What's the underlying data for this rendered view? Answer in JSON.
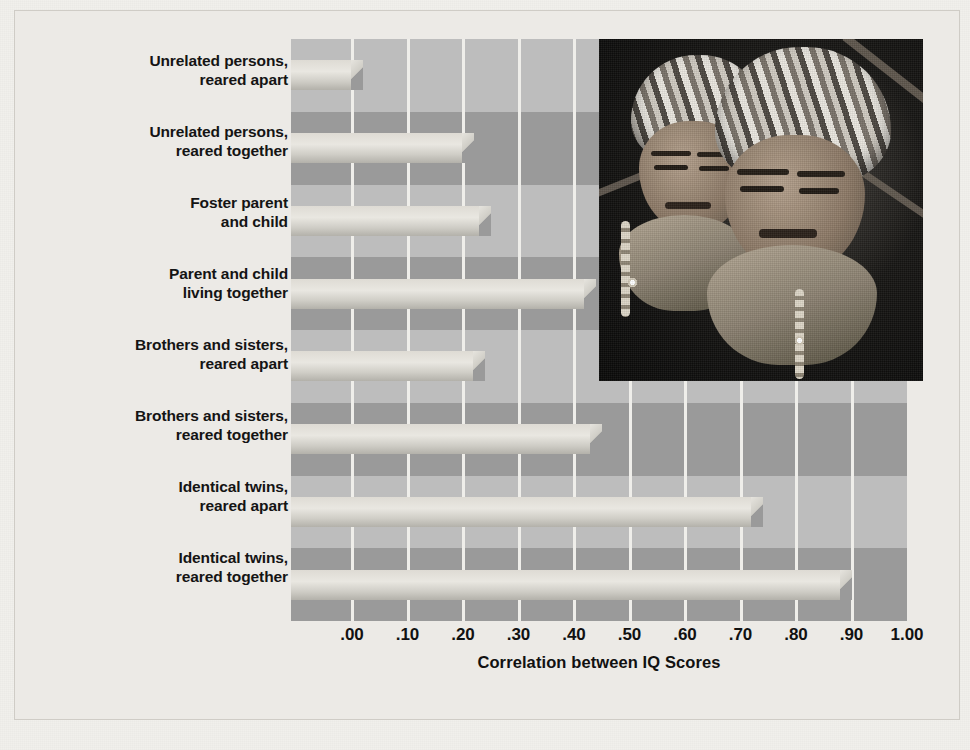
{
  "figure": {
    "background_color": "#eceae6",
    "plot_background_color": "#9a9a9a",
    "bar_color": "#e3e0d9",
    "gridline_color": "#efeeea"
  },
  "chart_data": {
    "type": "bar",
    "orientation": "horizontal",
    "title": "",
    "xlabel": "Correlation between IQ Scores",
    "ylabel": "",
    "xlim": [
      0.0,
      1.0
    ],
    "xticks": [
      0.0,
      0.1,
      0.2,
      0.3,
      0.4,
      0.5,
      0.6,
      0.7,
      0.8,
      0.9,
      1.0
    ],
    "xticklabels": [
      ".00",
      ".10",
      ".20",
      ".30",
      ".40",
      ".50",
      ".60",
      ".70",
      ".80",
      ".90",
      "1.00"
    ],
    "grid": true,
    "legend": false,
    "categories": [
      "Unrelated persons, reared apart",
      "Unrelated persons, reared together",
      "Foster parent and child",
      "Parent and child living together",
      "Brothers and sisters, reared apart",
      "Brothers and sisters, reared together",
      "Identical twins, reared apart",
      "Identical twins, reared together"
    ],
    "values": [
      0.02,
      0.22,
      0.25,
      0.44,
      0.24,
      0.45,
      0.74,
      0.9
    ]
  },
  "labels": [
    {
      "line1": "Unrelated persons,",
      "line2": "reared apart"
    },
    {
      "line1": "Unrelated persons,",
      "line2": "reared together"
    },
    {
      "line1": "Foster parent",
      "line2": "and child"
    },
    {
      "line1": "Parent and child",
      "line2": "living together"
    },
    {
      "line1": "Brothers and sisters,",
      "line2": "reared apart"
    },
    {
      "line1": "Brothers and sisters,",
      "line2": "reared together"
    },
    {
      "line1": "Identical twins,",
      "line2": "reared apart"
    },
    {
      "line1": "Identical twins,",
      "line2": "reared together"
    }
  ],
  "axis": {
    "title": "Correlation between IQ Scores"
  },
  "photo": {
    "alt": "Two young children wearing striped knitted caps and scarves"
  }
}
